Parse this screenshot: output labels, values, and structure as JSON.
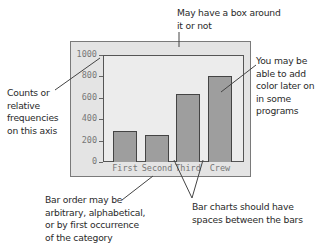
{
  "annotations": {
    "box": "May have a box around\nit or not",
    "box_lines": [
      "May have a box around",
      "it or not"
    ],
    "axis_lines": [
      "Counts or",
      "relative",
      "frequencies",
      "on this axis"
    ],
    "color_lines": [
      "You may be",
      " able to add",
      "color later on",
      "in some",
      "programs"
    ],
    "order_lines": [
      "Bar order may be",
      "arbitrary, alphabetical,",
      "or by first occurrence",
      "of the category"
    ],
    "spaces_lines": [
      "Bar charts should have",
      "spaces between the bars"
    ]
  },
  "colors": {
    "frame_bg": "#e4e4e4",
    "plot_bg": "#ececec",
    "bar_fill": "#9e9e9e",
    "bar_border": "#444444",
    "axis_text": "#777777"
  },
  "chart_data": {
    "type": "bar",
    "title": "",
    "xlabel": "",
    "ylabel": "",
    "categories": [
      "First",
      "Second",
      "Third",
      "Crew"
    ],
    "values": [
      290,
      255,
      640,
      800
    ],
    "ylim": [
      0,
      1000
    ],
    "yticks": [
      0,
      200,
      400,
      600,
      800,
      1000
    ],
    "ytick_labels": [
      "0",
      "200",
      "400",
      "600",
      "800",
      "1000"
    ],
    "grid": false,
    "legend": null
  }
}
